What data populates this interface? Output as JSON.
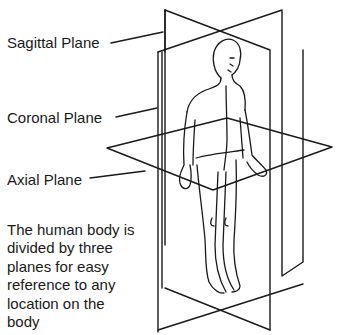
{
  "diagram": {
    "labels": {
      "sagittal": "Sagittal Plane",
      "coronal": "Coronal Plane",
      "axial": "Axial Plane"
    },
    "description_lines": [
      "The human body is",
      "divided by three",
      "planes for easy",
      "reference to any",
      "location on the",
      "body"
    ],
    "figure": "human-body-outline",
    "colors": {
      "line": "#1a1a1a",
      "text": "#1a1a1a",
      "background": "#ffffff"
    }
  }
}
